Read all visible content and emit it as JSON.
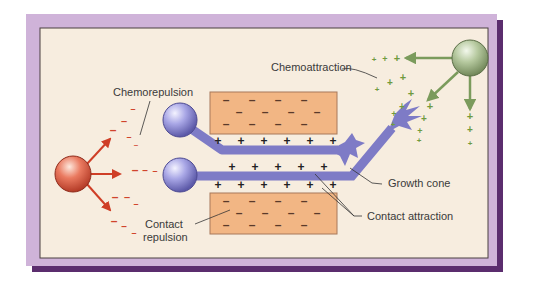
{
  "figure": {
    "labels": {
      "chemorepulsion": "Chemorepulsion",
      "chemoattraction": "Chemoattraction",
      "growth_cone": "Growth cone",
      "contact_attraction": "Contact attraction",
      "contact_repulsion_line1": "Contact",
      "contact_repulsion_line2": "repulsion"
    },
    "symbols": {
      "plus": "+",
      "minus": "–"
    },
    "colors": {
      "frame": "#cfb3d9",
      "frame_shadow": "#5b2d6e",
      "panel": "#f7eddf",
      "panel_border": "#4a4040",
      "neuron": "#8886d0",
      "neuron_dark": "#5f5ca8",
      "block": "#f2b684",
      "block_border": "#a8795a",
      "repellent_cell": "#e0614a",
      "attractant_cell": "#a9c092",
      "red_arrow": "#cf3e26",
      "green_arrow": "#7b9b5c"
    }
  }
}
